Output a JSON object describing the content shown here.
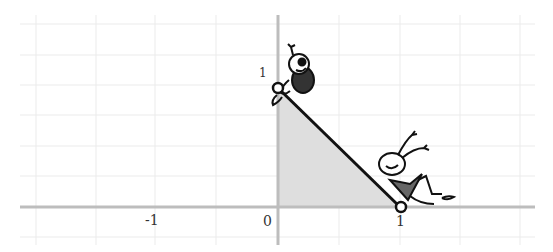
{
  "diagram": {
    "type": "coordinate-plane-illustration",
    "axes": {
      "x_tick_labels": [
        "-1",
        "0",
        "1"
      ],
      "y_tick_labels": [
        "1"
      ],
      "x_range": [
        -2,
        2
      ],
      "y_range": [
        -0.3,
        1.6
      ],
      "grid": true
    },
    "shape": {
      "type": "triangle",
      "vertices": [
        [
          0,
          0
        ],
        [
          1,
          0
        ],
        [
          0,
          1
        ]
      ],
      "fill": "#dcdcdc",
      "hypotenuse_color": "#111111"
    },
    "points": [
      {
        "label": "top-vertex",
        "x": 0,
        "y": 1
      },
      {
        "label": "right-vertex",
        "x": 1,
        "y": 0
      }
    ],
    "figures": [
      {
        "name": "cartoon-bug-sitting",
        "position": "top-vertex"
      },
      {
        "name": "cartoon-bug-lounging",
        "position": "right-vertex"
      }
    ],
    "colors": {
      "grid": "#e6e6e6",
      "axis": "#bdbdbd",
      "triangle_fill": "#dedede",
      "line": "#111111"
    }
  }
}
